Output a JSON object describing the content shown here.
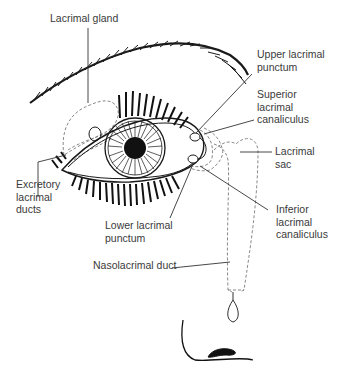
{
  "diagram": {
    "labels": {
      "lacrimal_gland": "Lacrimal gland",
      "upper_lacrimal_punctum": "Upper lacrimal\npunctum",
      "superior_lacrimal_canaliculus": "Superior\nlacrimal\ncanaliculus",
      "lacrimal_sac": "Lacrimal\nsac",
      "excretory_lacrimal_ducts": "Excretory\nlacrimal\nducts",
      "inferior_lacrimal_canaliculus": "Inferior\nlacrimal\ncanaliculus",
      "lower_lacrimal_punctum": "Lower lacrimal\npunctum",
      "nasolacrimal_duct": "Nasolacrimal duct"
    },
    "colors": {
      "line": "#1a1a1a",
      "dashed_outline": "#7a7a7a",
      "label_text": "#3a3a3a",
      "leader_line": "#333333"
    }
  }
}
